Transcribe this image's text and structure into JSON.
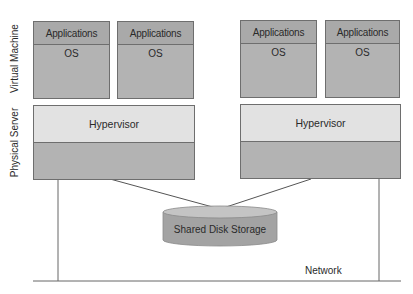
{
  "side_labels": {
    "virtual_machine": "Virtual Machine",
    "physical_server": "Physical Server"
  },
  "vms": [
    {
      "apps": "Applications",
      "os": "OS"
    },
    {
      "apps": "Applications",
      "os": "OS"
    },
    {
      "apps": "Applications",
      "os": "OS"
    },
    {
      "apps": "Applications",
      "os": "OS"
    }
  ],
  "servers": [
    {
      "hypervisor": "Hypervisor"
    },
    {
      "hypervisor": "Hypervisor"
    }
  ],
  "storage": {
    "label": "Shared Disk Storage"
  },
  "network": {
    "label": "Network"
  },
  "colors": {
    "vm_fill": "#b3b3b3",
    "hypervisor_fill": "#e2e2e2",
    "disk_fill": "#a8a8a8",
    "border": "#6e6e6e"
  }
}
